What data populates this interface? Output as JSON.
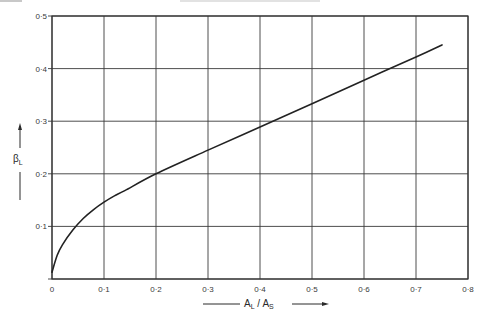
{
  "chart_data": {
    "type": "line",
    "title": "",
    "xlabel": "A_L / A_S",
    "ylabel": "β_L",
    "xlabel_parts": {
      "main1": "A",
      "sub1": "L",
      "sep": " / ",
      "main2": "A",
      "sub2": "S"
    },
    "ylabel_parts": {
      "main": "β",
      "sub": "L"
    },
    "xlim": [
      0,
      0.8
    ],
    "ylim": [
      0,
      0.5
    ],
    "xticks": [
      0,
      0.1,
      0.2,
      0.3,
      0.4,
      0.5,
      0.6,
      0.7,
      0.8
    ],
    "yticks": [
      0,
      0.1,
      0.2,
      0.3,
      0.4,
      0.5
    ],
    "xtick_labels": [
      "0",
      "0·1",
      "0·2",
      "0·3",
      "0·4",
      "0·5",
      "0·6",
      "0·7",
      "0·8"
    ],
    "ytick_labels": [
      "0",
      "0·1",
      "0·2",
      "0·3",
      "0·4",
      "0·5"
    ],
    "grid": true,
    "legend": null,
    "series": [
      {
        "name": "β_L vs A_L/A_S",
        "color": "#222222",
        "x": [
          0,
          0.01,
          0.02,
          0.04,
          0.06,
          0.08,
          0.1,
          0.12,
          0.14,
          0.2,
          0.3,
          0.4,
          0.5,
          0.6,
          0.7,
          0.75
        ],
        "y": [
          0.013,
          0.045,
          0.065,
          0.093,
          0.115,
          0.132,
          0.146,
          0.158,
          0.168,
          0.2,
          0.245,
          0.289,
          0.333,
          0.378,
          0.422,
          0.445
        ]
      }
    ]
  },
  "colors": {
    "background": "#ffffff",
    "grid": "#3a3a3a",
    "frame": "#333333",
    "curve": "#222222",
    "text": "#2a2a2a"
  }
}
